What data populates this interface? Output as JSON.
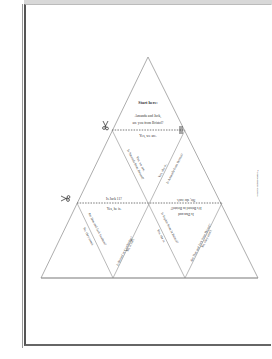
{
  "document": {
    "type": "tarsia-puzzle-worksheet",
    "start_label": "Start here:",
    "cells": {
      "top": {
        "question": "Amanda and Jack, are you from Bristol?",
        "answer_below": "Yes, we are."
      },
      "upper_left_edge_right": "Is Jack 11?",
      "upper_left_edge_slant_a": "Yes, we are.",
      "upper_left_edge_slant_b": "Is Amanda from Bristol?",
      "upper_right_edge_slant_a": "Yes, she is.",
      "upper_right_edge_slant_b": "Is Amanda from Bristol?",
      "middle_left_bottom": "Is Jack 11?",
      "middle_left_below": "Yes, he is.",
      "middle_right_bottom": "No, she isn't.",
      "middle_right_below_a": "It's Bristol in Bristol?",
      "middle_right_below_b": "Is Dan and",
      "lower": {
        "t1_a": "Are Dan and Jack brothers?",
        "t1_b": "No, they aren't.",
        "t2_a": "Is Bristol in Cambridge?",
        "t2_b": "No, it isn't.",
        "t3_a": "Is Sophie from in Bristol?",
        "t3_b": "Yes, she is.",
        "t4_a": "Are Dan and Jack from Bristol?",
        "t4_b": "No, they aren't."
      }
    },
    "side_note": "© photocopiable resource",
    "icons": [
      "scissors-icon",
      "scissors-icon"
    ]
  },
  "colors": {
    "line": "#8a8a8a",
    "cut_line": "#6a6a6a",
    "text": "#333333",
    "border": "#555555"
  }
}
